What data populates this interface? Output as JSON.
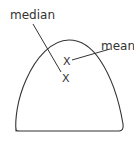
{
  "diagram": {
    "title": "",
    "stroke_color": "#333333",
    "background_color": "#ffffff",
    "labels": {
      "median": "median",
      "mean": "mean"
    },
    "marks": {
      "mean_mark": "X",
      "median_mark": "X"
    },
    "shape": "skewed distribution curve (closed at bottom)"
  }
}
